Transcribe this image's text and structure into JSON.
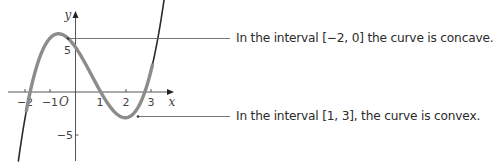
{
  "figure": {
    "axes": {
      "x_label": "x",
      "y_label": "y",
      "origin_label": "O",
      "x_ticks": [
        "−2",
        "−1",
        "1",
        "2",
        "3"
      ],
      "y_ticks": [
        "5",
        "−5"
      ]
    },
    "annotations": [
      {
        "text": "In the interval [−2, 0] the curve is concave."
      },
      {
        "text": "In the interval [1, 3], the curve is convex."
      }
    ],
    "colors": {
      "curve": "#2a2a2a",
      "curve_highlight": "#8c8c8c",
      "axes": "#555555",
      "pointer_lines": "#666666",
      "text": "#2b2b2b"
    }
  },
  "chart_data": {
    "type": "line",
    "title": "",
    "xlabel": "x",
    "ylabel": "y",
    "xlim": [
      -2.3,
      3.6
    ],
    "ylim": [
      -7.8,
      9.3
    ],
    "x_ticks": [
      -2,
      -1,
      1,
      2,
      3
    ],
    "y_ticks": [
      5,
      -5
    ],
    "grid": false,
    "series": [
      {
        "name": "cubic curve",
        "x": [
          -2.3,
          -2,
          -1.8,
          -1.5,
          -1,
          -0.6,
          0,
          0.5,
          1,
          1.5,
          2,
          2.4,
          2.75,
          3,
          3.3
        ],
        "y": [
          -7.7,
          -3.4,
          0,
          3.9,
          6.4,
          6.8,
          5.0,
          2.6,
          0,
          -1.8,
          -2.9,
          -2.4,
          0,
          3.0,
          8.6
        ]
      }
    ],
    "annotations": [
      {
        "text": "In the interval [−2, 0] the curve is concave.",
        "points_to": [
          -0.6,
          6.8
        ]
      },
      {
        "text": "In the interval [1, 3], the curve is convex.",
        "points_to": [
          2.4,
          -2.9
        ]
      }
    ],
    "features": {
      "local_max": [
        -0.6,
        6.8
      ],
      "local_min": [
        2.0,
        -3.0
      ],
      "y_intercept": 5,
      "x_intercepts": [
        -1.8,
        1,
        2.75
      ]
    }
  }
}
